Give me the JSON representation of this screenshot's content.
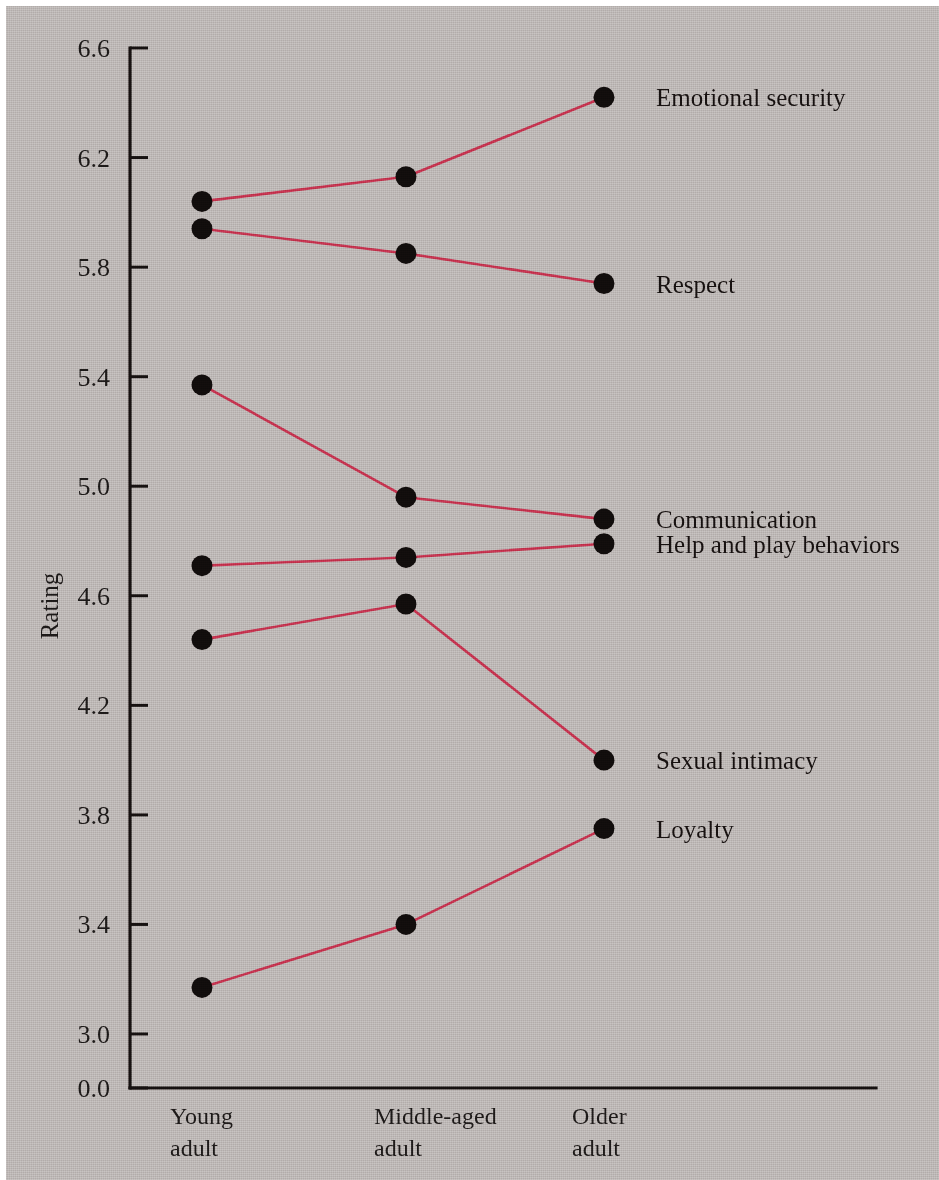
{
  "figure": {
    "background_color": "#b8b2b0",
    "accent_color": "#c0304a",
    "marker_color": "#100c0b",
    "axis_color": "#14100f"
  },
  "chart_data": {
    "type": "line",
    "title": "",
    "subtitle": "",
    "xlabel": "",
    "ylabel": "Rating",
    "categories": [
      "Young\nadult",
      "Middle-aged\nadult",
      "Older\nadult"
    ],
    "category_labels": [
      {
        "line1": "Young",
        "line2": "adult"
      },
      {
        "line1": "Middle-aged",
        "line2": "adult"
      },
      {
        "line1": "Older",
        "line2": "adult"
      }
    ],
    "x": [
      1,
      2,
      3
    ],
    "ylim": [
      2.9,
      6.7
    ],
    "yticks": [
      0.0,
      3.0,
      3.4,
      3.8,
      4.2,
      4.6,
      5.0,
      5.4,
      5.8,
      6.2,
      6.6
    ],
    "ytick_labels": [
      "0.0",
      "3.0",
      "3.4",
      "3.8",
      "4.2",
      "4.6",
      "5.0",
      "5.4",
      "5.8",
      "6.2",
      "6.6"
    ],
    "axis_break": true,
    "axis_break_note": "y-axis broken between 0.0 and 3.0",
    "grid": false,
    "legend_position": "right-of-endpoint",
    "series": [
      {
        "name": "Emotional security",
        "values": [
          6.04,
          6.13,
          6.42
        ]
      },
      {
        "name": "Respect",
        "values": [
          5.94,
          5.85,
          5.74
        ]
      },
      {
        "name": "Communication",
        "values": [
          5.37,
          4.96,
          4.88
        ]
      },
      {
        "name": "Help and play behaviors",
        "values": [
          4.71,
          4.74,
          4.79
        ]
      },
      {
        "name": "Sexual intimacy",
        "values": [
          4.44,
          4.57,
          4.0
        ]
      },
      {
        "name": "Loyalty",
        "values": [
          3.17,
          3.4,
          3.75
        ]
      }
    ]
  }
}
